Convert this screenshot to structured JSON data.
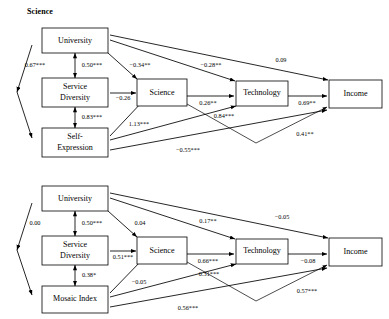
{
  "figure": {
    "type": "path-diagram",
    "panel_count": 2,
    "node_labels": {
      "university": "University",
      "service_diversity_line1": "Service",
      "service_diversity_line2": "Diversity",
      "self_expression_line1": "Self-",
      "self_expression_line2": "Expression",
      "mosaic_index": "Mosaic Index",
      "science": "Science",
      "technology": "Technology",
      "income": "Income"
    }
  },
  "panels": [
    {
      "id": "science",
      "title": "Science",
      "nodes": [
        {
          "id": "university",
          "label": "University"
        },
        {
          "id": "service_diversity",
          "label": "Service Diversity"
        },
        {
          "id": "self_expression",
          "label": "Self-Expression"
        },
        {
          "id": "science",
          "label": "Science"
        },
        {
          "id": "technology",
          "label": "Technology"
        },
        {
          "id": "income",
          "label": "Income"
        }
      ],
      "coefficients": {
        "univ_selfexp_cov": "0.67***",
        "univ_servdiv_cov": "0.50***",
        "univ_science": "−0.34**",
        "univ_technology": "−0.28**",
        "univ_income": "0.09",
        "servdiv_science": "−0.26",
        "servdiv_selfexp_cov": "0.83***",
        "selfexp_science": "1.13***",
        "selfexp_technology": "0.84***",
        "selfexp_income": "−0.55***",
        "science_technology": "0.26**",
        "science_income": "0.41**",
        "technology_income": "0.69**"
      }
    },
    {
      "id": "mosaic",
      "title": "",
      "nodes": [
        {
          "id": "university",
          "label": "University"
        },
        {
          "id": "service_diversity",
          "label": "Service Diversity"
        },
        {
          "id": "mosaic_index",
          "label": "Mosaic Index"
        },
        {
          "id": "science",
          "label": "Science"
        },
        {
          "id": "technology",
          "label": "Technology"
        },
        {
          "id": "income",
          "label": "Income"
        }
      ],
      "coefficients": {
        "univ_mosaic_cov": "0.00",
        "univ_servdiv_cov": "0.50***",
        "univ_science": "0.04",
        "univ_technology": "0.17**",
        "univ_income": "−0.05",
        "servdiv_science": "0.51***",
        "servdiv_mosaic_cov": "0.38*",
        "mosaic_science": "−0.05",
        "mosaic_technology": "0.31***",
        "mosaic_income": "0.56***",
        "science_technology": "0.66***",
        "science_income": "0.57***",
        "technology_income": "−0.08"
      }
    }
  ],
  "colors": {
    "stroke": "#000000",
    "background": "#ffffff",
    "text": "#000000"
  }
}
